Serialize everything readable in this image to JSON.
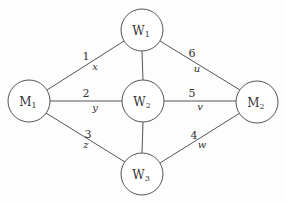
{
  "nodes": {
    "M1": {
      "label": "M",
      "sub": "1",
      "cx": 29,
      "cy": 101,
      "r": 21
    },
    "W1": {
      "label": "W",
      "sub": "1",
      "cx": 142,
      "cy": 30,
      "r": 21
    },
    "W2": {
      "label": "W",
      "sub": "2",
      "cx": 143,
      "cy": 101,
      "r": 21
    },
    "W3": {
      "label": "W",
      "sub": "3",
      "cx": 142,
      "cy": 174,
      "r": 21
    },
    "M2": {
      "label": "M",
      "sub": "2",
      "cx": 257,
      "cy": 102,
      "r": 21
    }
  },
  "edges": [
    {
      "from": "M1",
      "to": "W1",
      "number": "1",
      "variable": "x"
    },
    {
      "from": "M1",
      "to": "W2",
      "number": "2",
      "variable": "y"
    },
    {
      "from": "M1",
      "to": "W3",
      "number": "3",
      "variable": "z"
    },
    {
      "from": "W3",
      "to": "M2",
      "number": "4",
      "variable": "w"
    },
    {
      "from": "W2",
      "to": "M2",
      "number": "5",
      "variable": "v"
    },
    {
      "from": "W1",
      "to": "M2",
      "number": "6",
      "variable": "u"
    },
    {
      "from": "W1",
      "to": "W2",
      "number": "",
      "variable": ""
    },
    {
      "from": "W2",
      "to": "W3",
      "number": "",
      "variable": ""
    }
  ]
}
